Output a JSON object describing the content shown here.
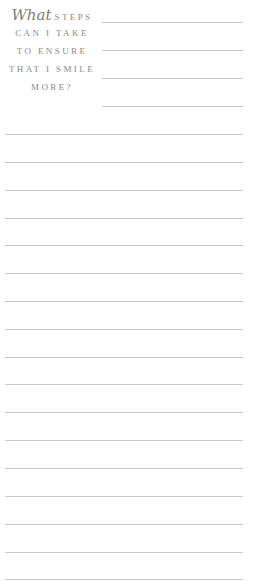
{
  "heading": {
    "script_word": "What",
    "lines": [
      "STEPS",
      "CAN I TAKE",
      "TO ENSURE",
      "THAT I SMILE",
      "MORE?"
    ]
  },
  "header_rules": [
    22,
    50,
    78,
    106
  ],
  "body_rules": [
    134,
    162,
    190,
    218,
    245,
    273,
    301,
    329,
    357,
    384,
    412,
    440,
    468,
    496,
    524,
    552,
    579
  ],
  "colors": {
    "text": "#8a8a8a",
    "rule": "#c9c9c9"
  }
}
